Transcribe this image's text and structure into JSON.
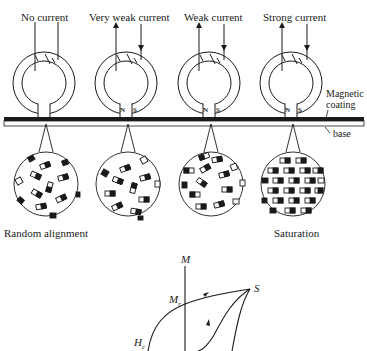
{
  "heads": [
    {
      "label": "No current",
      "poles": false,
      "arrows": false
    },
    {
      "label": "Very weak current",
      "poles": true,
      "arrows": true
    },
    {
      "label": "Weak current",
      "poles": true,
      "arrows": true
    },
    {
      "label": "Strong current",
      "poles": true,
      "arrows": true
    }
  ],
  "pole_labels": {
    "north": "N",
    "south": "S"
  },
  "media_labels": {
    "coating": "Magnetic\ncoating",
    "coating_line1": "Magnetic",
    "coating_line2": "coating",
    "base": "base"
  },
  "domain_captions": {
    "first": "Random alignment",
    "last": "Saturation"
  },
  "hysteresis": {
    "axis_label": "M",
    "remanence_label": "M",
    "remanence_sub": "r",
    "coercivity_label": "H",
    "coercivity_sub": "c",
    "saturation_label": "S"
  },
  "colors": {
    "ink": "#1a1a1a",
    "background": "#ffffff"
  }
}
